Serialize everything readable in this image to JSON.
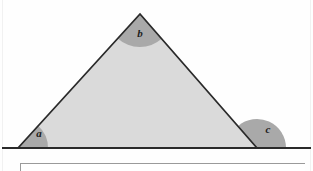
{
  "figure": {
    "labels": {
      "angle_a": "a",
      "angle_b": "b",
      "angle_c": "c"
    },
    "colors": {
      "triangle_fill": "#dadada",
      "triangle_stroke": "#2a2a2a",
      "angle_sector_fill": "#a9a9a9",
      "baseline_stroke": "#2a2a2a",
      "page_background": "#fefefe",
      "caption_border": "#9a9a9a",
      "label_text": "#1b1b1b"
    },
    "geometry": {
      "vertex_left": {
        "x": 18,
        "y": 148
      },
      "vertex_apex": {
        "x": 140,
        "y": 14
      },
      "vertex_right": {
        "x": 257,
        "y": 148
      },
      "baseline_start_x": 2,
      "baseline_end_x": 311,
      "baseline_y": 148,
      "sector_radius_a": 30,
      "sector_radius_b": 33,
      "sector_radius_c": 29
    },
    "label_positions": {
      "a": {
        "x": 39,
        "y": 134
      },
      "b": {
        "x": 140,
        "y": 34
      },
      "c": {
        "x": 268,
        "y": 130
      }
    }
  }
}
